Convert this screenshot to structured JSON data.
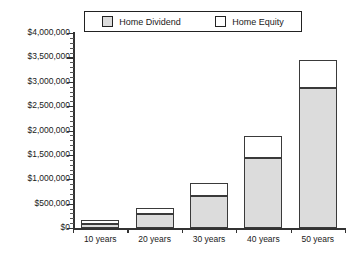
{
  "legend": {
    "entries": [
      {
        "label": "Home Dividend",
        "color": "#dcdcdc",
        "swatch": "dividend-swatch"
      },
      {
        "label": "Home Equity",
        "color": "#ffffff",
        "swatch": "equity-swatch"
      }
    ]
  },
  "chart_data": {
    "type": "bar",
    "stacked": true,
    "title": "",
    "xlabel": "",
    "ylabel": "",
    "ylim": [
      0,
      4000000
    ],
    "ytick_step": 500000,
    "grid": false,
    "legend_position": "top",
    "categories": [
      "10 years",
      "20 years",
      "30 years",
      "40 years",
      "50 years"
    ],
    "ytick_labels": [
      "$0",
      "$500,000",
      "$1,000,000",
      "$1,500,000",
      "$2,000,000",
      "$2,500,000",
      "$3,000,000",
      "$3,500,000",
      "$4,000,000"
    ],
    "ytick_values": [
      0,
      500000,
      1000000,
      1500000,
      2000000,
      2500000,
      3000000,
      3500000,
      4000000
    ],
    "series": [
      {
        "name": "Home Dividend",
        "color": "#dcdcdc",
        "values": [
          80000,
          290000,
          660000,
          1440000,
          2870000
        ]
      },
      {
        "name": "Home Equity",
        "color": "#ffffff",
        "values": [
          80000,
          120000,
          260000,
          450000,
          580000
        ]
      }
    ],
    "totals": [
      160000,
      410000,
      920000,
      1890000,
      3450000
    ]
  }
}
